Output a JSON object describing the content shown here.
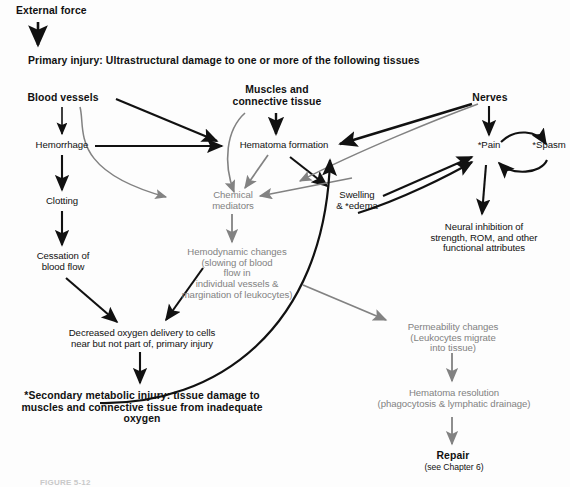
{
  "figure": {
    "caption": "FIGURE 5-12",
    "colors": {
      "black": "#111111",
      "gray": "#828282",
      "background": "#fdfdfd"
    }
  },
  "nodes": {
    "external_force": "External force",
    "primary_injury": "Primary injury: Ultrastructural damage to one or more of the following tissues",
    "blood_vessels": "Blood vessels",
    "muscles_connective": "Muscles and\nconnective tissue",
    "nerves": "Nerves",
    "hemorrhage": "Hemorrhage",
    "hematoma_formation": "Hematoma formation",
    "pain": "*Pain",
    "spasm": "*Spasm",
    "clotting": "Clotting",
    "chemical_mediators": "Chemical\nmediators",
    "swelling_edema": "Swelling\n& *edema",
    "neural_inhibition": "Neural inhibition of\nstrength, ROM, and other\nfunctional attributes",
    "cessation_blood_flow": "Cessation of\nblood flow",
    "hemodynamic_changes": "Hemodynamic changes\n(slowing of blood\nflow in\nindividual vessels &\nmargination of leukocytes)",
    "decreased_oxygen": "Decreased oxygen delivery to cells\nnear but not part of, primary injury",
    "permeability_changes": "Permeability changes\n(Leukocytes migrate\ninto tissue)",
    "secondary_metabolic_injury": "*Secondary metabolic injury: tissue damage to\nmuscles and connective tissue from inadequate oxygen",
    "hematoma_resolution": "Hematoma resolution\n(phagocytosis & lymphatic drainage)",
    "repair": "Repair",
    "repair_sub": "(see Chapter 6)"
  }
}
